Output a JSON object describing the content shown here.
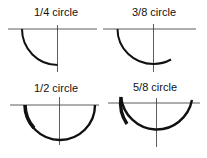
{
  "diagram": {
    "title": "",
    "colors": {
      "line": "#222222",
      "arc": "#111111",
      "background": "#ffffff"
    },
    "panels": [
      {
        "label": "1/4 circle",
        "fraction": "1/4",
        "degrees": 90
      },
      {
        "label": "3/8 circle",
        "fraction": "3/8",
        "degrees": 135
      },
      {
        "label": "1/2 circle",
        "fraction": "1/2",
        "degrees": 180
      },
      {
        "label": "5/8 circle",
        "fraction": "5/8",
        "degrees": 225
      }
    ]
  }
}
